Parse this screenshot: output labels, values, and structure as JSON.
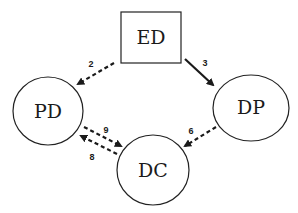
{
  "diagram": {
    "nodes": [
      {
        "id": "ED",
        "label": "ED",
        "shape": "rectangle"
      },
      {
        "id": "PD",
        "label": "PD",
        "shape": "circle"
      },
      {
        "id": "DP",
        "label": "DP",
        "shape": "circle"
      },
      {
        "id": "DC",
        "label": "DC",
        "shape": "circle"
      }
    ],
    "edges": [
      {
        "from": "ED",
        "to": "PD",
        "label": "2",
        "style": "dashed"
      },
      {
        "from": "ED",
        "to": "DP",
        "label": "3",
        "style": "solid"
      },
      {
        "from": "DP",
        "to": "DC",
        "label": "6",
        "style": "dashed"
      },
      {
        "from": "DC",
        "to": "PD",
        "label": "8",
        "style": "dashed"
      },
      {
        "from": "PD",
        "to": "DC",
        "label": "9",
        "style": "dashed"
      }
    ]
  }
}
